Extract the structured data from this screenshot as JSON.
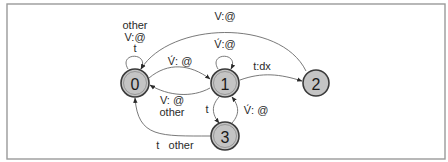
{
  "diagram": {
    "type": "finite-state-transducer",
    "nodes": [
      {
        "id": "0",
        "label": "0",
        "final": true
      },
      {
        "id": "1",
        "label": "1",
        "final": true
      },
      {
        "id": "2",
        "label": "2",
        "final": false
      },
      {
        "id": "3",
        "label": "3",
        "final": true
      }
    ],
    "edges": [
      {
        "from": "0",
        "to": "0",
        "label_lines": [
          "other",
          "V:@",
          "t"
        ]
      },
      {
        "from": "0",
        "to": "1",
        "label_lines": [
          "V́: @"
        ]
      },
      {
        "from": "1",
        "to": "0",
        "label_lines": [
          "V: @",
          "other"
        ]
      },
      {
        "from": "1",
        "to": "1",
        "label_lines": [
          "V́:@"
        ]
      },
      {
        "from": "1",
        "to": "2",
        "label_lines": [
          "t:dx"
        ]
      },
      {
        "from": "2",
        "to": "0",
        "label_lines": [
          "V:@"
        ]
      },
      {
        "from": "1",
        "to": "3",
        "label_lines": [
          "t"
        ]
      },
      {
        "from": "3",
        "to": "1",
        "label_lines": [
          "V́: @"
        ]
      },
      {
        "from": "3",
        "to": "0",
        "label_lines": [
          "t   other"
        ]
      }
    ]
  }
}
